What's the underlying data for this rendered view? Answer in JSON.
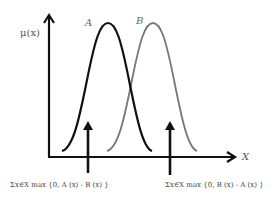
{
  "diagram": {
    "y_axis_label": "μ(x)",
    "x_axis_label": "X",
    "curves": [
      {
        "label": "A",
        "color": "#1a1a1a",
        "peak_x": 108
      },
      {
        "label": "B",
        "color": "#777777",
        "peak_x": 153
      }
    ],
    "formulas": [
      "Σx∈X  max {0, A (x)  -  B (x) }",
      "Σx∈X  max {0, B (x)  -  A (x) }"
    ]
  }
}
